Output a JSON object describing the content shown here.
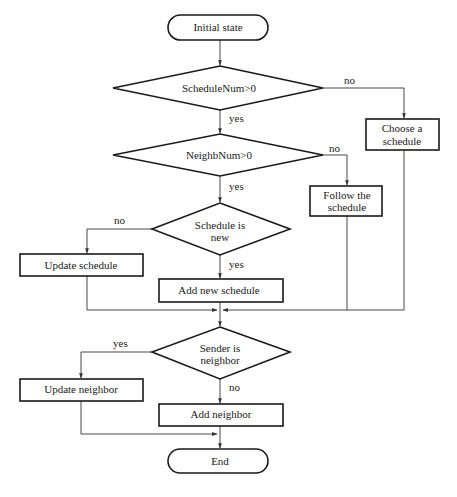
{
  "diagram": {
    "type": "flowchart",
    "colors": {
      "stroke": "#1a1a1a",
      "edge": "#333333",
      "background": "#ffffff"
    },
    "nodes": {
      "start": {
        "shape": "terminal",
        "label": "Initial state"
      },
      "d_schedule_num": {
        "shape": "decision",
        "label": "ScheduleNum>0"
      },
      "choose_schedule": {
        "shape": "process",
        "line1": "Choose a",
        "line2": "schedule"
      },
      "d_neighb_num": {
        "shape": "decision",
        "label": "NeighbNum>0"
      },
      "follow_schedule": {
        "shape": "process",
        "line1": "Follow the",
        "line2": "schedule"
      },
      "d_schedule_new": {
        "shape": "decision",
        "line1": "Schedule is",
        "line2": "new"
      },
      "update_schedule": {
        "shape": "process",
        "label": "Update schedule"
      },
      "add_new_schedule": {
        "shape": "process",
        "label": "Add new schedule"
      },
      "d_sender_neighbor": {
        "shape": "decision",
        "line1": "Sender is",
        "line2": "neighbor"
      },
      "update_neighbor": {
        "shape": "process",
        "label": "Update neighbor"
      },
      "add_neighbor": {
        "shape": "process",
        "label": "Add neighbor"
      },
      "end": {
        "shape": "terminal",
        "label": "End"
      }
    },
    "edge_labels": {
      "schedule_num_no": "no",
      "schedule_num_yes": "yes",
      "neighb_num_no": "no",
      "neighb_num_yes": "yes",
      "schedule_new_no": "no",
      "schedule_new_yes": "yes",
      "sender_neighbor_yes": "yes",
      "sender_neighbor_no": "no"
    },
    "edges": [
      {
        "from": "start",
        "to": "d_schedule_num"
      },
      {
        "from": "d_schedule_num",
        "to": "choose_schedule",
        "label": "no"
      },
      {
        "from": "d_schedule_num",
        "to": "d_neighb_num",
        "label": "yes"
      },
      {
        "from": "d_neighb_num",
        "to": "follow_schedule",
        "label": "no"
      },
      {
        "from": "d_neighb_num",
        "to": "d_schedule_new",
        "label": "yes"
      },
      {
        "from": "d_schedule_new",
        "to": "update_schedule",
        "label": "no"
      },
      {
        "from": "d_schedule_new",
        "to": "add_new_schedule",
        "label": "yes"
      },
      {
        "from": "update_schedule",
        "to": "d_sender_neighbor"
      },
      {
        "from": "add_new_schedule",
        "to": "d_sender_neighbor"
      },
      {
        "from": "follow_schedule",
        "to": "d_sender_neighbor"
      },
      {
        "from": "choose_schedule",
        "to": "d_sender_neighbor"
      },
      {
        "from": "d_sender_neighbor",
        "to": "update_neighbor",
        "label": "yes"
      },
      {
        "from": "d_sender_neighbor",
        "to": "add_neighbor",
        "label": "no"
      },
      {
        "from": "update_neighbor",
        "to": "end"
      },
      {
        "from": "add_neighbor",
        "to": "end"
      }
    ]
  }
}
